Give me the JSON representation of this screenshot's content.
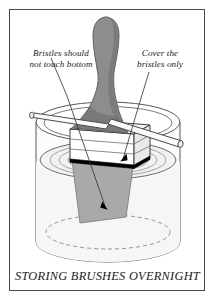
{
  "figure": {
    "caption": "STORING BRUSHES OVERNIGHT",
    "annotations": {
      "left": "Bristles should\nnot touch bottom",
      "right": "Cover the\nbristles only"
    },
    "colors": {
      "ink": "#4a4a4a",
      "text": "#1a1a1a",
      "frame": "#4a4a4a",
      "handle_fill": "#8d8d8d",
      "bristle_fill": "#a8a8a8",
      "ferrule_fill": "#ffffff",
      "jar_fill": "#fcfcfc",
      "liquid_fill": "#f4f4f4",
      "liquid_line": "#000000",
      "dowel_fill": "#fafafa",
      "background": "#ffffff"
    },
    "icon_names": [
      "paintbrush-icon",
      "jar-icon",
      "dowel-rod-icon",
      "liquid-ripple-icon",
      "leader-arrow-icon"
    ]
  }
}
